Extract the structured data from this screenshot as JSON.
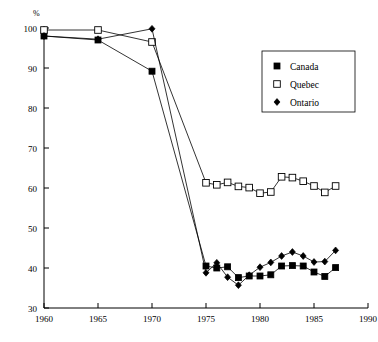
{
  "chart_data": {
    "type": "line",
    "title": "",
    "xlabel": "",
    "ylabel": "%",
    "xlim": [
      1960,
      1990
    ],
    "ylim": [
      30,
      100
    ],
    "xticks": [
      1960,
      1965,
      1970,
      1975,
      1980,
      1985,
      1990
    ],
    "yticks": [
      30,
      40,
      50,
      60,
      70,
      80,
      90,
      100
    ],
    "grid": false,
    "legend_position": "upper right",
    "series": [
      {
        "name": "Canada",
        "marker": "filled-square",
        "x": [
          1960,
          1965,
          1970,
          1975,
          1976,
          1977,
          1978,
          1979,
          1980,
          1981,
          1982,
          1983,
          1984,
          1985,
          1986,
          1987
        ],
        "values": [
          98.0,
          97.0,
          89.2,
          40.5,
          40.0,
          40.3,
          37.6,
          38.0,
          38.0,
          38.3,
          40.5,
          40.6,
          40.5,
          39.0,
          37.9,
          40.1
        ]
      },
      {
        "name": "Quebec",
        "marker": "open-square",
        "x": [
          1960,
          1965,
          1970,
          1975,
          1976,
          1977,
          1978,
          1979,
          1980,
          1981,
          1982,
          1983,
          1984,
          1985,
          1986,
          1987
        ],
        "values": [
          99.5,
          99.5,
          96.5,
          61.3,
          60.8,
          61.4,
          60.4,
          60.1,
          58.7,
          59.0,
          62.8,
          62.6,
          61.7,
          60.5,
          58.9,
          60.5
        ]
      },
      {
        "name": "Ontario",
        "marker": "filled-diamond",
        "x": [
          1960,
          1965,
          1970,
          1975,
          1976,
          1977,
          1978,
          1979,
          1980,
          1981,
          1982,
          1983,
          1984,
          1985,
          1986,
          1987
        ],
        "values": [
          98.0,
          97.2,
          99.8,
          38.8,
          41.3,
          37.7,
          35.7,
          38.2,
          40.2,
          41.4,
          43.0,
          44.0,
          43.0,
          41.5,
          41.6,
          44.4
        ]
      }
    ]
  },
  "legend": {
    "entries": [
      {
        "label": "Canada",
        "marker": "filled-square"
      },
      {
        "label": "Quebec",
        "marker": "open-square"
      },
      {
        "label": "Ontario",
        "marker": "filled-diamond"
      }
    ]
  },
  "colors": {
    "foreground": "#000000",
    "background": "#ffffff"
  }
}
